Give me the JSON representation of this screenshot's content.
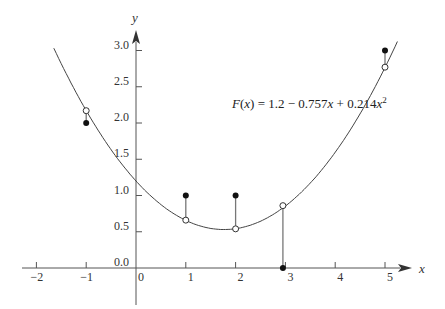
{
  "chart_data": {
    "type": "scatter",
    "title": "",
    "xlabel": "x",
    "ylabel": "y",
    "xlim": [
      -2.2,
      5.4
    ],
    "ylim": [
      -0.7,
      3.2
    ],
    "x_ticks": [
      "-2",
      "-1",
      "0",
      "1",
      "2",
      "3",
      "4",
      "5"
    ],
    "y_ticks": [
      "0.0",
      "0.5",
      "1.0",
      "1.5",
      "2.0",
      "2.5",
      "3.0"
    ],
    "grid": false,
    "annotation": "F(x) = 1.2 - 0.757x + 0.214x^2",
    "fit": {
      "a0": 1.2,
      "a1": -0.757,
      "a2": 0.214,
      "x_range": [
        -1.65,
        5.25
      ]
    },
    "series": [
      {
        "name": "data (filled)",
        "x": [
          -1,
          1,
          2,
          3,
          5
        ],
        "y": [
          2.0,
          1.0,
          1.0,
          0.0,
          3.0
        ]
      },
      {
        "name": "fitted F(x) (open)",
        "x": [
          -1,
          1,
          2,
          3,
          5
        ],
        "y": [
          2.17,
          0.66,
          0.54,
          0.86,
          2.77
        ]
      }
    ]
  },
  "labels": {
    "x_axis": "x",
    "y_axis": "y",
    "equation_prefix": "F(x) = 1.2 − 0.757x + 0.214x",
    "equation_sup": "2"
  }
}
